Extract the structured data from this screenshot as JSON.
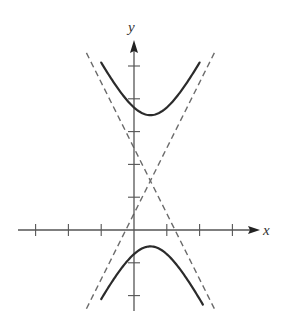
{
  "chart_data": {
    "type": "line",
    "title": "",
    "xlabel": "x",
    "ylabel": "y",
    "equation": "(y-1.5)^2/4 - (x-0.5)^2 = 1",
    "center": [
      0.5,
      1.5
    ],
    "a": 2,
    "b": 1,
    "xlim": [
      -3.0,
      3.8
    ],
    "ylim": [
      -2.5,
      5.8
    ],
    "x_ticks": [
      -3,
      -2,
      -1,
      1,
      2,
      3
    ],
    "y_ticks": [
      -2,
      -1,
      1,
      2,
      3,
      4,
      5
    ],
    "series": [
      {
        "name": "upper-branch",
        "style": "solid",
        "x_range": [
          -1.0,
          2.0
        ]
      },
      {
        "name": "lower-branch",
        "style": "solid",
        "x_range": [
          -1.0,
          2.1
        ]
      },
      {
        "name": "asymptote-positive",
        "style": "dashed",
        "slope": 2,
        "x_range": [
          -1.45,
          2.5
        ]
      },
      {
        "name": "asymptote-negative",
        "style": "dashed",
        "slope": -2,
        "x_range": [
          -1.45,
          2.45
        ]
      }
    ],
    "grid": false,
    "colors": {
      "curve": "#2b2b2b",
      "asymptote": "#6b6b6b",
      "axis": "#555555"
    }
  }
}
